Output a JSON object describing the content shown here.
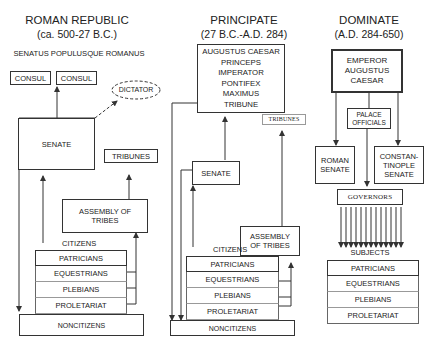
{
  "columns": {
    "republic": {
      "title": "ROMAN REPUBLIC",
      "dates": "(ca. 500-27 B.C.)",
      "motto": "SENATUS POPULUSQUE ROMANUS",
      "consul1": "CONSUL",
      "consul2": "CONSUL",
      "dictator": "DICTATOR",
      "senate": "SENATE",
      "tribunes": "TRIBUNES",
      "assembly": "ASSEMBLY OF TRIBES",
      "citizens_label": "CITIZENS",
      "classes": [
        "PATRICIANS",
        "EQUESTRIANS",
        "PLEBIANS",
        "PROLETARIAT"
      ],
      "noncitizens": "NONCITIZENS"
    },
    "principate": {
      "title": "PRINCIPATE",
      "dates": "(27 B.C.-A.D. 284)",
      "emperor_lines": [
        "AUGUSTUS CAESAR",
        "PRINCEPS",
        "IMPERATOR",
        "PONTIFEX",
        "MAXIMUS",
        "TRIBUNE"
      ],
      "tribunes": "TRIBUNES",
      "senate": "SENATE",
      "assembly": "ASSEMBLY OF TRIBES",
      "citizens_label": "CITIZENS",
      "classes": [
        "PATRICIANS",
        "EQUESTRIANS",
        "PLEBIANS",
        "PROLETARIAT"
      ],
      "noncitizens": "NONCITIZENS"
    },
    "dominate": {
      "title": "DOMINATE",
      "dates": "(A.D. 284-650)",
      "emperor_lines": [
        "EMPEROR",
        "AUGUSTUS",
        "CAESAR"
      ],
      "palace": "PALACE OFFICIALS",
      "roman_senate": "ROMAN SENATE",
      "const_senate_lines": [
        "CONSTAN-",
        "TINOPLE",
        "SENATE"
      ],
      "governors": "GOVERNORS",
      "subjects_label": "SUBJECTS",
      "classes": [
        "PATRICIANS",
        "EQUESTRIANS",
        "PLEBIANS",
        "PROLETARIAT"
      ]
    }
  },
  "colors": {
    "line": "#333333",
    "background": "#ffffff"
  }
}
